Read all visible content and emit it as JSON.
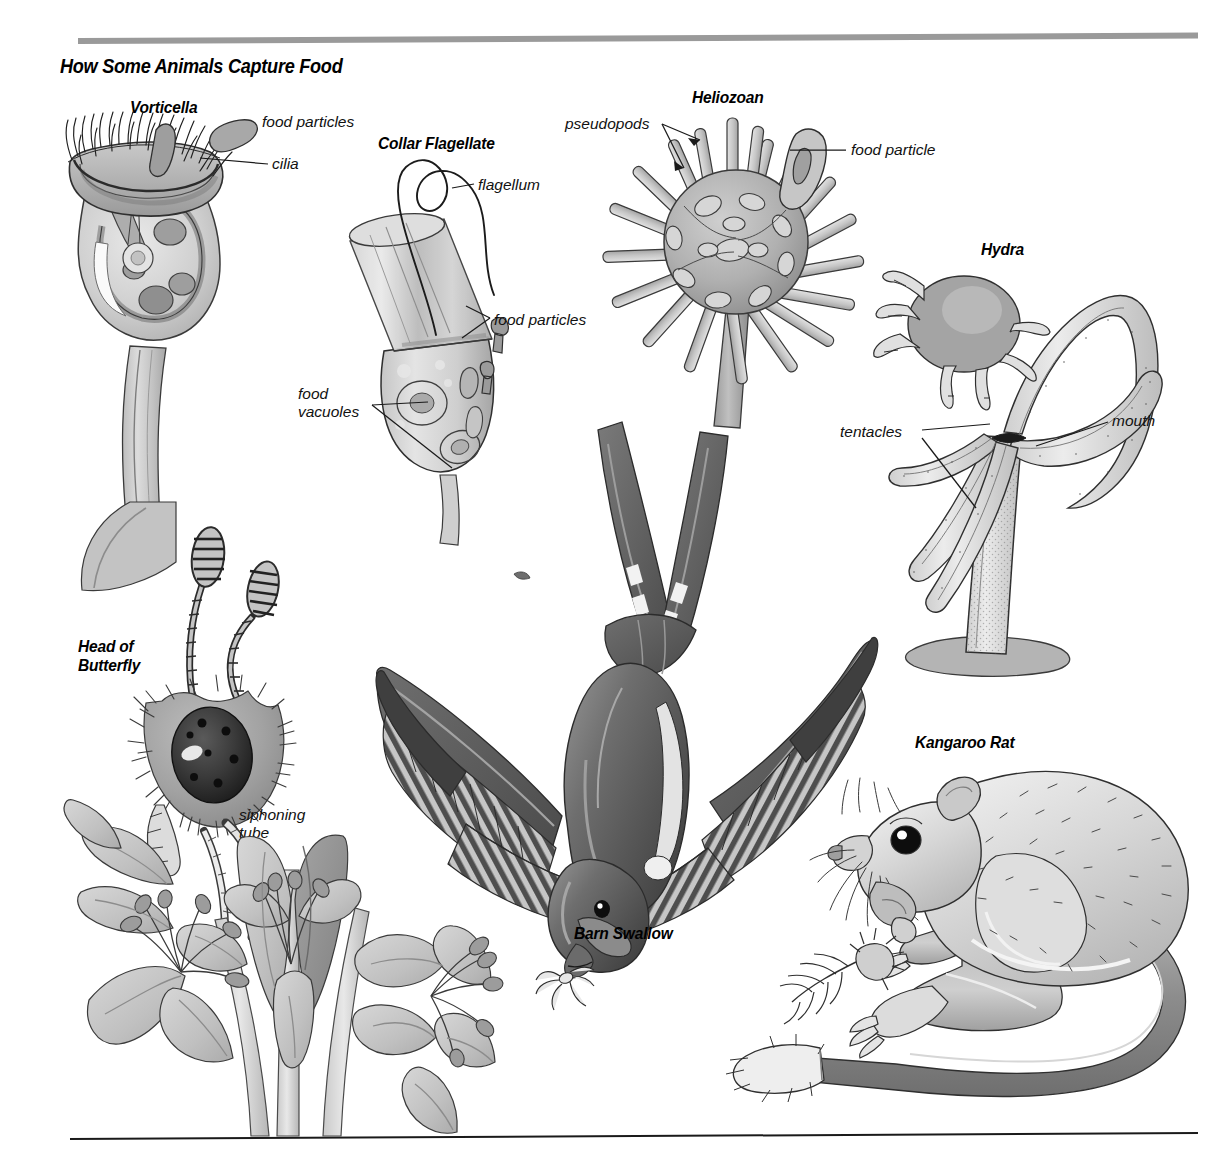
{
  "page": {
    "title": "How Some Animals Capture Food",
    "rules": {
      "top_color": "#9a9a9a",
      "bottom_color": "#1a1a1a"
    }
  },
  "figures": [
    {
      "id": "vorticella",
      "heading": "Vorticella",
      "labels": [
        {
          "name": "food-particles",
          "text": "food particles"
        },
        {
          "name": "cilia",
          "text": "cilia"
        }
      ]
    },
    {
      "id": "collar-flagellate",
      "heading": "Collar Flagellate",
      "labels": [
        {
          "name": "flagellum",
          "text": "flagellum"
        },
        {
          "name": "food-particles",
          "text": "food particles"
        },
        {
          "name": "food-vacuoles",
          "text": "food\nvacuoles"
        }
      ]
    },
    {
      "id": "heliozoan",
      "heading": "Heliozoan",
      "labels": [
        {
          "name": "pseudopods",
          "text": "pseudopods"
        },
        {
          "name": "food-particle",
          "text": "food particle"
        }
      ]
    },
    {
      "id": "hydra",
      "heading": "Hydra",
      "labels": [
        {
          "name": "tentacles",
          "text": "tentacles"
        },
        {
          "name": "mouth",
          "text": "mouth"
        }
      ]
    },
    {
      "id": "butterfly",
      "heading": "Head of\nButterfly",
      "labels": [
        {
          "name": "siphoning-tube",
          "text": "siphoning\ntube"
        }
      ]
    },
    {
      "id": "barn-swallow",
      "heading": "Barn Swallow",
      "labels": []
    },
    {
      "id": "kangaroo-rat",
      "heading": "Kangaroo Rat",
      "labels": []
    }
  ],
  "text": {
    "title": "How Some Animals Capture Food",
    "vorticella_heading": "Vorticella",
    "vorticella_food_particles": "food particles",
    "vorticella_cilia": "cilia",
    "collar_heading": "Collar Flagellate",
    "collar_flagellum": "flagellum",
    "collar_food_particles": "food particles",
    "collar_food_vacuoles_l1": "food",
    "collar_food_vacuoles_l2": "vacuoles",
    "heliozoan_heading": "Heliozoan",
    "heliozoan_pseudopods": "pseudopods",
    "heliozoan_food_particle": "food particle",
    "hydra_heading": "Hydra",
    "hydra_tentacles": "tentacles",
    "hydra_mouth": "mouth",
    "butterfly_heading_l1": "Head of",
    "butterfly_heading_l2": "Butterfly",
    "butterfly_siphoning_l1": "siphoning",
    "butterfly_siphoning_l2": "tube",
    "swallow_heading": "Barn Swallow",
    "rat_heading": "Kangaroo Rat"
  },
  "palette": {
    "ink": "#1a1a1a",
    "gray_light": "#d9d9d9",
    "gray_mid": "#b4b4b4",
    "gray_dark": "#8a8a8a",
    "gray_darker": "#6a6a6a",
    "gray_deep": "#4d4d4d",
    "white": "#ffffff"
  }
}
